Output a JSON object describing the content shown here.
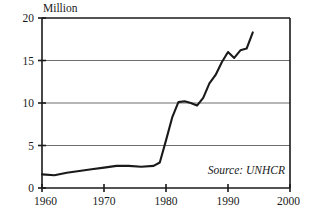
{
  "chart_data": {
    "type": "line",
    "title": "",
    "unit_label": "Million",
    "xlabel": "",
    "ylabel": "",
    "xlim": [
      1960,
      2000
    ],
    "ylim": [
      0,
      20
    ],
    "xticks": [
      1960,
      1970,
      1980,
      1990,
      2000
    ],
    "yticks": [
      0,
      5,
      10,
      15,
      20
    ],
    "xtick_labels": [
      "1960",
      "1970",
      "1980",
      "1990",
      "2000"
    ],
    "ytick_labels": [
      "0",
      "5",
      "10",
      "15",
      "20"
    ],
    "grid": "horizontal",
    "legend": "none",
    "annotations": [
      {
        "text": "Source: UNHCR",
        "x": 1988.5,
        "y": 2.0,
        "style": "italic"
      }
    ],
    "series": [
      {
        "name": "Refugees",
        "color": "#1a1a1a",
        "x": [
          1960,
          1962,
          1964,
          1966,
          1968,
          1970,
          1972,
          1974,
          1976,
          1978,
          1979,
          1980,
          1981,
          1982,
          1983,
          1984,
          1985,
          1986,
          1987,
          1988,
          1989,
          1990,
          1991,
          1992,
          1993,
          1994
        ],
        "values": [
          1.6,
          1.5,
          1.8,
          2.0,
          2.2,
          2.4,
          2.6,
          2.6,
          2.5,
          2.6,
          3.0,
          5.6,
          8.3,
          10.1,
          10.2,
          10.0,
          9.7,
          10.6,
          12.3,
          13.3,
          14.8,
          16.0,
          15.3,
          16.2,
          16.4,
          18.3
        ]
      }
    ]
  },
  "source": {
    "text": "Source: UNHCR"
  }
}
